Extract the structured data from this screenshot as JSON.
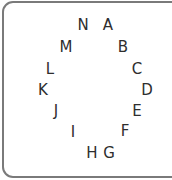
{
  "panel": {
    "letters": [
      {
        "char": "A",
        "x": 108,
        "y": 25
      },
      {
        "char": "B",
        "x": 123,
        "y": 47
      },
      {
        "char": "C",
        "x": 137,
        "y": 69
      },
      {
        "char": "D",
        "x": 147,
        "y": 90
      },
      {
        "char": "E",
        "x": 137,
        "y": 111
      },
      {
        "char": "F",
        "x": 125,
        "y": 131
      },
      {
        "char": "G",
        "x": 109,
        "y": 153
      },
      {
        "char": "H",
        "x": 92,
        "y": 153
      },
      {
        "char": "I",
        "x": 73,
        "y": 132
      },
      {
        "char": "J",
        "x": 56,
        "y": 111
      },
      {
        "char": "K",
        "x": 43,
        "y": 90
      },
      {
        "char": "L",
        "x": 50,
        "y": 69
      },
      {
        "char": "M",
        "x": 66,
        "y": 47
      },
      {
        "char": "N",
        "x": 83,
        "y": 25
      }
    ]
  }
}
